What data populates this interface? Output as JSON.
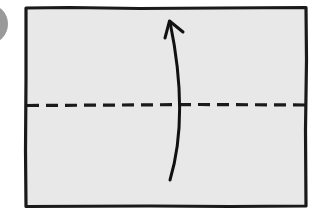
{
  "diagram": {
    "type": "origami-fold-instruction",
    "paper": {
      "fill": "#e8e8e8",
      "stroke": "#1a1a1a",
      "x": 25,
      "y": 7,
      "width": 282,
      "height": 200
    },
    "fold_line": {
      "style": "dashed",
      "label": "valley fold",
      "y": 105,
      "color": "#1a1a1a"
    },
    "arrow": {
      "direction": "up",
      "meaning": "fold bottom edge up",
      "color": "#111111"
    },
    "step_marker": {
      "shape": "circle",
      "color": "#9a9a9a",
      "partially_visible": true
    }
  }
}
